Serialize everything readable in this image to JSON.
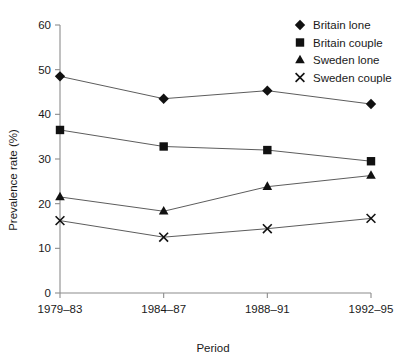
{
  "chart_data": {
    "type": "line",
    "title": "",
    "xlabel": "Period",
    "ylabel": "Prevalence rate (%)",
    "categories": [
      "1979–83",
      "1984–87",
      "1988–91",
      "1992–95"
    ],
    "ylim": [
      0,
      60
    ],
    "yticks": [
      0,
      10,
      20,
      30,
      40,
      50,
      60
    ],
    "ytick_labels": [
      "0",
      "10",
      "20",
      "30",
      "40",
      "50",
      "60"
    ],
    "grid": false,
    "legend_position": "top-right",
    "series": [
      {
        "name": "Britain lone",
        "marker": "diamond",
        "values": [
          48.5,
          43.5,
          45.3,
          42.3
        ]
      },
      {
        "name": "Britain couple",
        "marker": "square",
        "values": [
          36.5,
          32.8,
          32.0,
          29.5
        ]
      },
      {
        "name": "Sweden lone",
        "marker": "triangle",
        "values": [
          21.5,
          18.3,
          23.8,
          26.3
        ]
      },
      {
        "name": "Sweden couple",
        "marker": "cross",
        "values": [
          16.2,
          12.5,
          14.4,
          16.7
        ]
      }
    ],
    "colors": {
      "marker": "#111111",
      "line": "#4a4a4a",
      "axis": "#8c8c8c",
      "text": "#1a1a1a",
      "background": "#ffffff"
    }
  }
}
